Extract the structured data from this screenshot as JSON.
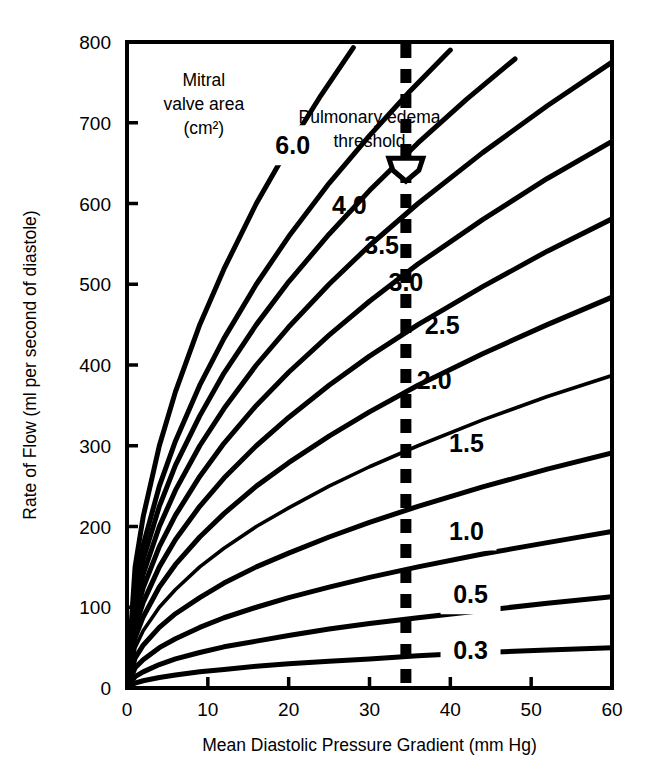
{
  "chart_data": {
    "type": "line",
    "title": "",
    "xlabel": "Mean Diastolic Pressure Gradient (mm Hg)",
    "ylabel": "Rate of Flow (ml per second of diastole)",
    "xlim": [
      0,
      60
    ],
    "ylim": [
      0,
      800
    ],
    "xticks": [
      "0",
      "10",
      "20",
      "30",
      "40",
      "50",
      "60"
    ],
    "xtick_values": [
      0,
      10,
      20,
      30,
      40,
      50,
      60
    ],
    "yticks": [
      "0",
      "100",
      "200",
      "300",
      "400",
      "500",
      "600",
      "700",
      "800"
    ],
    "ytick_values": [
      0,
      100,
      200,
      300,
      400,
      500,
      600,
      700,
      800
    ],
    "grid": false,
    "legend_position": "inline-curve-labels",
    "legend_title": "Mitral valve area (cm²)",
    "relation": "flow = k * area * sqrt(gradient)",
    "series": [
      {
        "name": "6.0",
        "label": "6.0",
        "area_cm2": 6.0,
        "label_x": 20.5,
        "label_y": 672,
        "points": [
          [
            0,
            0
          ],
          [
            1,
            150
          ],
          [
            2,
            212
          ],
          [
            4,
            300
          ],
          [
            6,
            367
          ],
          [
            9,
            450
          ],
          [
            12,
            519
          ],
          [
            16,
            600
          ],
          [
            20,
            670
          ],
          [
            24,
            734
          ],
          [
            28,
            793
          ]
        ]
      },
      {
        "name": "5.0",
        "label": "",
        "area_cm2": 5.0,
        "label_x": null,
        "label_y": null,
        "points": [
          [
            0,
            0
          ],
          [
            1,
            125
          ],
          [
            2,
            177
          ],
          [
            4,
            250
          ],
          [
            6,
            306
          ],
          [
            9,
            375
          ],
          [
            12,
            433
          ],
          [
            16,
            500
          ],
          [
            20,
            559
          ],
          [
            25,
            625
          ],
          [
            30,
            684
          ],
          [
            35,
            739
          ],
          [
            40,
            790
          ]
        ]
      },
      {
        "name": "4.5",
        "label": "",
        "area_cm2": 4.5,
        "label_x": null,
        "label_y": null,
        "points": [
          [
            0,
            0
          ],
          [
            1,
            112
          ],
          [
            2,
            159
          ],
          [
            4,
            225
          ],
          [
            6,
            276
          ],
          [
            9,
            337
          ],
          [
            12,
            390
          ],
          [
            16,
            450
          ],
          [
            20,
            503
          ],
          [
            25,
            562
          ],
          [
            30,
            616
          ],
          [
            36,
            675
          ],
          [
            42,
            729
          ],
          [
            48,
            779
          ]
        ]
      },
      {
        "name": "4.0",
        "label": "4.0",
        "area_cm2": 4.0,
        "label_x": 27.5,
        "label_y": 598,
        "points": [
          [
            0,
            0
          ],
          [
            1,
            100
          ],
          [
            2,
            141
          ],
          [
            4,
            200
          ],
          [
            6,
            245
          ],
          [
            9,
            300
          ],
          [
            12,
            346
          ],
          [
            16,
            400
          ],
          [
            20,
            447
          ],
          [
            25,
            500
          ],
          [
            30,
            548
          ],
          [
            36,
            600
          ],
          [
            44,
            663
          ],
          [
            52,
            721
          ],
          [
            60,
            775
          ]
        ]
      },
      {
        "name": "3.5",
        "label": "3.5",
        "area_cm2": 3.5,
        "label_x": 31.5,
        "label_y": 548,
        "points": [
          [
            0,
            0
          ],
          [
            1,
            87
          ],
          [
            2,
            124
          ],
          [
            4,
            175
          ],
          [
            6,
            214
          ],
          [
            9,
            262
          ],
          [
            12,
            303
          ],
          [
            16,
            350
          ],
          [
            20,
            391
          ],
          [
            25,
            437
          ],
          [
            30,
            479
          ],
          [
            36,
            525
          ],
          [
            44,
            580
          ],
          [
            52,
            631
          ],
          [
            60,
            677
          ]
        ]
      },
      {
        "name": "3.0",
        "label": "3.0",
        "area_cm2": 3.0,
        "label_x": 34.5,
        "label_y": 503,
        "points": [
          [
            0,
            0
          ],
          [
            1,
            75
          ],
          [
            2,
            106
          ],
          [
            4,
            150
          ],
          [
            6,
            184
          ],
          [
            9,
            225
          ],
          [
            12,
            260
          ],
          [
            16,
            300
          ],
          [
            20,
            335
          ],
          [
            25,
            375
          ],
          [
            30,
            411
          ],
          [
            36,
            450
          ],
          [
            44,
            497
          ],
          [
            52,
            541
          ],
          [
            60,
            581
          ]
        ]
      },
      {
        "name": "2.5",
        "label": "2.5",
        "area_cm2": 2.5,
        "label_x": 39.0,
        "label_y": 450,
        "points": [
          [
            0,
            0
          ],
          [
            1,
            62
          ],
          [
            2,
            88
          ],
          [
            4,
            125
          ],
          [
            6,
            153
          ],
          [
            9,
            187
          ],
          [
            12,
            216
          ],
          [
            16,
            250
          ],
          [
            20,
            279
          ],
          [
            25,
            312
          ],
          [
            30,
            342
          ],
          [
            36,
            375
          ],
          [
            44,
            414
          ],
          [
            52,
            450
          ],
          [
            60,
            484
          ]
        ]
      },
      {
        "name": "2.0",
        "label": "2.0",
        "area_cm2": 2.0,
        "label_x": 38.0,
        "label_y": 382,
        "points": [
          [
            0,
            0
          ],
          [
            1,
            50
          ],
          [
            2,
            71
          ],
          [
            4,
            100
          ],
          [
            6,
            122
          ],
          [
            9,
            150
          ],
          [
            12,
            173
          ],
          [
            16,
            200
          ],
          [
            20,
            223
          ],
          [
            25,
            250
          ],
          [
            30,
            274
          ],
          [
            36,
            300
          ],
          [
            44,
            332
          ],
          [
            52,
            361
          ],
          [
            60,
            387
          ]
        ]
      },
      {
        "name": "1.5",
        "label": "1.5",
        "area_cm2": 1.5,
        "label_x": 42.0,
        "label_y": 303,
        "points": [
          [
            0,
            0
          ],
          [
            1,
            37
          ],
          [
            2,
            53
          ],
          [
            4,
            75
          ],
          [
            6,
            92
          ],
          [
            9,
            112
          ],
          [
            12,
            130
          ],
          [
            16,
            150
          ],
          [
            20,
            167
          ],
          [
            25,
            187
          ],
          [
            30,
            205
          ],
          [
            36,
            225
          ],
          [
            44,
            249
          ],
          [
            52,
            271
          ],
          [
            60,
            291
          ]
        ]
      },
      {
        "name": "1.0",
        "label": "1.0",
        "area_cm2": 1.0,
        "label_x": 42.0,
        "label_y": 195,
        "points": [
          [
            0,
            0
          ],
          [
            1,
            25
          ],
          [
            2,
            35
          ],
          [
            4,
            50
          ],
          [
            6,
            61
          ],
          [
            9,
            75
          ],
          [
            12,
            87
          ],
          [
            16,
            100
          ],
          [
            20,
            112
          ],
          [
            25,
            125
          ],
          [
            30,
            137
          ],
          [
            36,
            150
          ],
          [
            44,
            166
          ],
          [
            52,
            180
          ],
          [
            60,
            194
          ]
        ]
      },
      {
        "name": "0.5",
        "label": "0.5",
        "area_cm2": 0.5,
        "label_x": 42.5,
        "label_y": 116,
        "points": [
          [
            0,
            0
          ],
          [
            1,
            14
          ],
          [
            2,
            20
          ],
          [
            4,
            29
          ],
          [
            6,
            36
          ],
          [
            9,
            44
          ],
          [
            12,
            51
          ],
          [
            16,
            58
          ],
          [
            20,
            65
          ],
          [
            25,
            73
          ],
          [
            30,
            80
          ],
          [
            36,
            87
          ],
          [
            44,
            96
          ],
          [
            52,
            105
          ],
          [
            60,
            113
          ]
        ]
      },
      {
        "name": "0.3",
        "label": "0.3",
        "area_cm2": 0.3,
        "label_x": 42.5,
        "label_y": 47,
        "points": [
          [
            0,
            0
          ],
          [
            1,
            6
          ],
          [
            2,
            9
          ],
          [
            4,
            13
          ],
          [
            6,
            16
          ],
          [
            9,
            20
          ],
          [
            12,
            23
          ],
          [
            16,
            27
          ],
          [
            20,
            30
          ],
          [
            25,
            33
          ],
          [
            30,
            36
          ],
          [
            36,
            40
          ],
          [
            44,
            44
          ],
          [
            52,
            47
          ],
          [
            60,
            50
          ]
        ]
      }
    ],
    "annotations": [
      {
        "name": "legend-title",
        "text_lines": [
          "Mitral",
          "valve area",
          "(cm²)"
        ],
        "x": 9.5,
        "y": 745
      },
      {
        "name": "threshold-label",
        "text_lines": [
          "Pulmonary edema",
          "threshold"
        ],
        "x": 30.0,
        "y": 700
      },
      {
        "name": "threshold-line",
        "type": "vertical-dashed",
        "x_value": 34.5,
        "color": "#000000"
      },
      {
        "name": "threshold-marker",
        "type": "pentagon-arrow",
        "x_value": 34.5,
        "y_value": 640
      }
    ]
  },
  "labels": {
    "legend_line1": "Mitral",
    "legend_line2": "valve area",
    "legend_line3": "(cm²)",
    "threshold_line1": "Pulmonary edema",
    "threshold_line2": "threshold"
  }
}
